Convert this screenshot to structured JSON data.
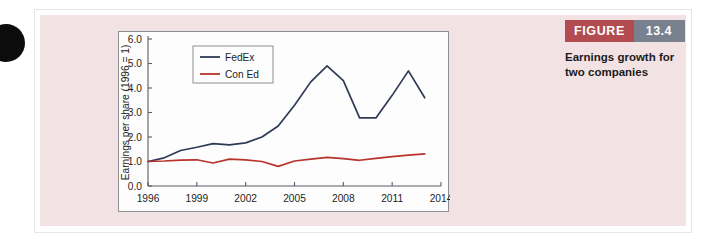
{
  "figure": {
    "badge_word": "FIGURE",
    "badge_number": "13.4",
    "caption": "Earnings growth for two companies",
    "badge_word_color": "#b24c50",
    "badge_number_color": "#79808e",
    "card_color": "#f3e2e4"
  },
  "chart_data": {
    "type": "line",
    "title": "",
    "xlabel": "",
    "ylabel": "Earnings per share (1996 = 1)",
    "xlim": [
      1996,
      2014
    ],
    "ylim": [
      0.0,
      6.0
    ],
    "grid": false,
    "legend_position": "top-left",
    "xticks": [
      "1996",
      "1999",
      "2002",
      "2005",
      "2008",
      "2011",
      "2014"
    ],
    "xtick_values": [
      1996,
      1999,
      2002,
      2005,
      2008,
      2011,
      2014
    ],
    "yticks": [
      "0.0",
      "1.0",
      "2.0",
      "3.0",
      "4.0",
      "5.0",
      "6.0"
    ],
    "ytick_values": [
      0.0,
      1.0,
      2.0,
      3.0,
      4.0,
      5.0,
      6.0
    ],
    "x": [
      1996,
      1997,
      1998,
      1999,
      2000,
      2001,
      2002,
      2003,
      2004,
      2005,
      2006,
      2007,
      2008,
      2009,
      2010,
      2011,
      2012,
      2013
    ],
    "series": [
      {
        "name": "FedEx",
        "color": "#2f3a56",
        "values": [
          1.0,
          1.15,
          1.45,
          1.58,
          1.73,
          1.68,
          1.76,
          2.0,
          2.45,
          3.3,
          4.25,
          4.9,
          4.3,
          2.78,
          2.78,
          3.7,
          4.7,
          3.6
        ]
      },
      {
        "name": "Con Ed",
        "color": "#b8332c",
        "values": [
          1.0,
          1.02,
          1.06,
          1.07,
          0.94,
          1.1,
          1.07,
          1.0,
          0.8,
          1.02,
          1.1,
          1.17,
          1.12,
          1.05,
          1.13,
          1.2,
          1.26,
          1.31
        ]
      }
    ]
  }
}
